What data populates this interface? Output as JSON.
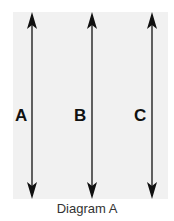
{
  "diagram": {
    "caption": "Diagram A",
    "background_color": "#f1f1f1",
    "arrows": [
      {
        "label": "A",
        "type": "double-headed-vertical"
      },
      {
        "label": "B",
        "type": "double-headed-vertical"
      },
      {
        "label": "C",
        "type": "double-headed-vertical"
      }
    ]
  }
}
